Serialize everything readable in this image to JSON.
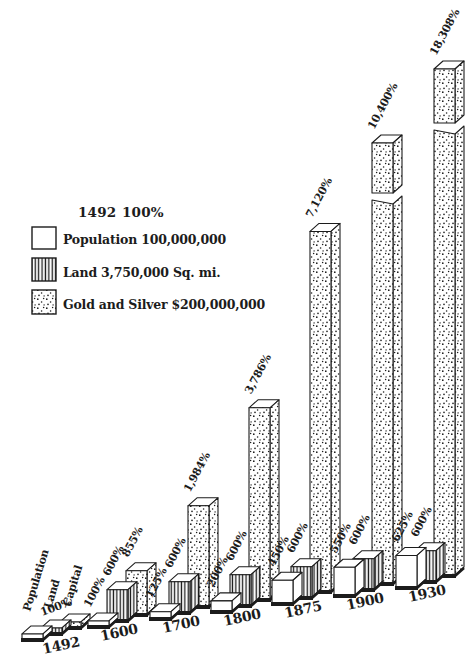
{
  "page": {
    "background": "#ffffff",
    "ink": "#1c1c1c"
  },
  "header": {
    "base_year": "1492",
    "base_pct": "100%"
  },
  "legend": {
    "items": [
      {
        "label": "Population 100,000,000",
        "pattern": "plain",
        "icon": "plain-swatch"
      },
      {
        "label": "Land 3,750,000 Sq. mi.",
        "pattern": "vertical-stripes",
        "icon": "striped-swatch"
      },
      {
        "label": "Gold and Silver $200,000,000",
        "pattern": "dots",
        "icon": "dotted-swatch"
      }
    ]
  },
  "chart_data": {
    "type": "bar",
    "style": "3d-pictorial-engraving",
    "title": "",
    "baseline_note": {
      "year": "1492",
      "pct": "100%"
    },
    "categories": [
      "1492",
      "1600",
      "1700",
      "1800",
      "1875",
      "1900",
      "1930"
    ],
    "series": [
      {
        "name": "Population",
        "legend_label": "Population 100,000,000",
        "pattern": "plain",
        "values_pct": [
          100,
          100,
          125,
          200,
          450,
          550,
          625
        ],
        "value_labels": [
          "100%",
          "100%",
          "125%",
          "200%",
          "450%",
          "550%",
          "625%"
        ]
      },
      {
        "name": "Land",
        "legend_label": "Land 3,750,000 Sq. mi.",
        "pattern": "vertical-stripes",
        "values_pct": [
          100,
          600,
          600,
          600,
          600,
          600,
          600
        ],
        "value_labels": [
          "",
          "600%",
          "600%",
          "600%",
          "600%",
          "600%",
          "600%"
        ]
      },
      {
        "name": "Capital",
        "legend_label": "Gold and Silver $200,000,000",
        "pattern": "dots",
        "values_pct": [
          100,
          855,
          1984,
          3786,
          7120,
          10400,
          18308
        ],
        "value_labels": [
          "",
          "855%",
          "1,984%",
          "3,786%",
          "7,120%",
          "10,400%",
          "18,308%"
        ]
      }
    ],
    "broken_bars": [
      {
        "series": "Capital",
        "category": "1900"
      },
      {
        "series": "Capital",
        "category": "1930"
      }
    ],
    "legend_position": "upper-left",
    "grid": false
  }
}
